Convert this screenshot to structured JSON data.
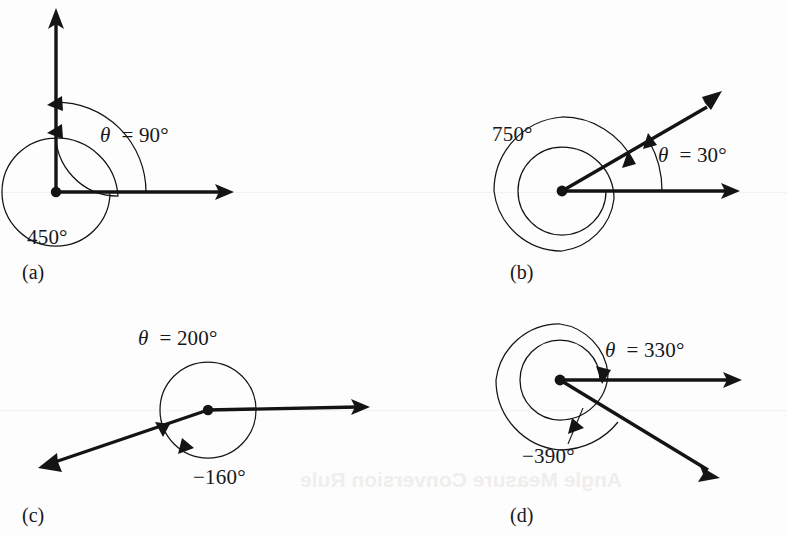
{
  "figure": {
    "kind": "coterminal-angles-figure",
    "background_color": "#fdfdfd",
    "ink_color": "#141414",
    "panels": [
      {
        "id": "a",
        "letter": "(a)",
        "theta_label": "θ = 90°",
        "coterminal_label": "450°",
        "theta_degrees": 90,
        "coterminal_degrees": 450,
        "turns": 1,
        "direction": "counterclockwise",
        "initial_side": "positive x-axis",
        "terminal_side": "positive y-axis"
      },
      {
        "id": "b",
        "letter": "(b)",
        "theta_label": "θ = 30°",
        "coterminal_label": "750°",
        "theta_degrees": 30,
        "coterminal_degrees": 750,
        "turns": 2,
        "direction": "counterclockwise",
        "initial_side": "positive x-axis",
        "terminal_side": "ray at 30 degrees"
      },
      {
        "id": "c",
        "letter": "(c)",
        "theta_label": "θ = 200°",
        "coterminal_label": "−160°",
        "theta_degrees": 200,
        "coterminal_degrees": -160,
        "turns": 0,
        "direction": "clockwise",
        "initial_side": "positive x-axis",
        "terminal_side": "ray at 200 degrees"
      },
      {
        "id": "d",
        "letter": "(d)",
        "theta_label": "θ = 330°",
        "coterminal_label": "−390°",
        "theta_degrees": 330,
        "coterminal_degrees": -390,
        "turns": 1,
        "direction": "clockwise",
        "initial_side": "positive x-axis",
        "terminal_side": "ray at 330 degrees"
      }
    ],
    "page_bleed_text": [
      "Angle Measure Conversion Rule"
    ]
  }
}
